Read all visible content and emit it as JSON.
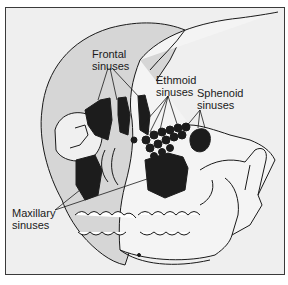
{
  "figure": {
    "colors": {
      "background": "#efefef",
      "frame": "#3a3a3a",
      "skull_back": "#d6d6d6",
      "skull_front": "#f2f2f2",
      "sinus_fill": "#1c1c1c",
      "line": "#1a1a1a"
    },
    "labels": [
      {
        "id": "frontal",
        "line1": "Frontal",
        "line2": "sinuses"
      },
      {
        "id": "ethmoid",
        "line1": "Ethmoid",
        "line2": "sinuses"
      },
      {
        "id": "sphenoid",
        "line1": "Sphenoid",
        "line2": "sinuses"
      },
      {
        "id": "maxillary",
        "line1": "Maxillary",
        "line2": "sinuses"
      }
    ]
  }
}
